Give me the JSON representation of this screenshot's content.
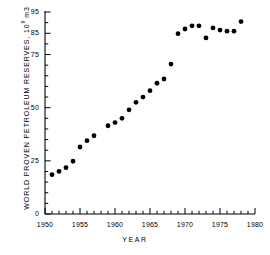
{
  "chart_data": {
    "type": "scatter",
    "title": "",
    "xlabel": "YEAR",
    "ylabel": "WORLD PROVEN PETROLEUM RESERVES, 10⁹ m3",
    "ylabel_text": "WORLD PROVEN PETROLEUM RESERVES, ",
    "ylabel_mantissa": "10",
    "ylabel_exponent": "9",
    "ylabel_units": " m3",
    "xlim": [
      1950,
      1980
    ],
    "ylim": [
      0,
      95
    ],
    "grid": false,
    "legend": null,
    "x_tick_labels": [
      "1950",
      "1955",
      "1960",
      "1965",
      "1970",
      "1975",
      "1980"
    ],
    "x_tick_values": [
      1950,
      1955,
      1960,
      1965,
      1970,
      1975,
      1980
    ],
    "x_minor_tick_step": 1,
    "y_tick_labels": [
      "0",
      "25",
      "50",
      "75",
      "85",
      "95"
    ],
    "y_tick_values": [
      0,
      25,
      50,
      75,
      85,
      95
    ],
    "y_minor_tick_values": [
      5,
      10,
      15,
      20,
      30,
      35,
      40,
      45,
      55,
      60,
      65,
      70,
      80,
      90
    ],
    "marker": "filled-circle",
    "marker_color": "#000000",
    "marker_size": 4,
    "x": [
      1951,
      1952,
      1953,
      1954,
      1955,
      1956,
      1957,
      1959,
      1960,
      1961,
      1962,
      1963,
      1964,
      1965,
      1966,
      1967,
      1968,
      1969,
      1970,
      1971,
      1972,
      1973,
      1974,
      1975,
      1976,
      1977,
      1978
    ],
    "values": [
      18.5,
      20.0,
      21.8,
      24.8,
      31.5,
      34.5,
      36.8,
      41.5,
      43.0,
      45.0,
      49.0,
      52.5,
      55.0,
      58.0,
      61.5,
      63.5,
      70.5,
      84.8,
      87.0,
      88.5,
      88.5,
      82.8,
      87.5,
      86.5,
      86.0,
      86.0,
      90.5
    ],
    "series": [
      {
        "name": "World proven petroleum reserves",
        "points": [
          {
            "year": 1951,
            "value": 18.5
          },
          {
            "year": 1952,
            "value": 20.0
          },
          {
            "year": 1953,
            "value": 21.8
          },
          {
            "year": 1954,
            "value": 24.8
          },
          {
            "year": 1955,
            "value": 31.5
          },
          {
            "year": 1956,
            "value": 34.5
          },
          {
            "year": 1957,
            "value": 36.8
          },
          {
            "year": 1959,
            "value": 41.5
          },
          {
            "year": 1960,
            "value": 43.0
          },
          {
            "year": 1961,
            "value": 45.0
          },
          {
            "year": 1962,
            "value": 49.0
          },
          {
            "year": 1963,
            "value": 52.5
          },
          {
            "year": 1964,
            "value": 55.0
          },
          {
            "year": 1965,
            "value": 58.0
          },
          {
            "year": 1966,
            "value": 61.5
          },
          {
            "year": 1967,
            "value": 63.5
          },
          {
            "year": 1968,
            "value": 70.5
          },
          {
            "year": 1969,
            "value": 84.8
          },
          {
            "year": 1970,
            "value": 87.0
          },
          {
            "year": 1971,
            "value": 88.5
          },
          {
            "year": 1972,
            "value": 88.5
          },
          {
            "year": 1973,
            "value": 82.8
          },
          {
            "year": 1974,
            "value": 87.5
          },
          {
            "year": 1975,
            "value": 86.5
          },
          {
            "year": 1976,
            "value": 86.0
          },
          {
            "year": 1977,
            "value": 86.0
          },
          {
            "year": 1978,
            "value": 90.5
          }
        ]
      }
    ]
  },
  "style": {
    "axis_color": "#000000",
    "background": "#ffffff",
    "marker_color": "#000000"
  }
}
